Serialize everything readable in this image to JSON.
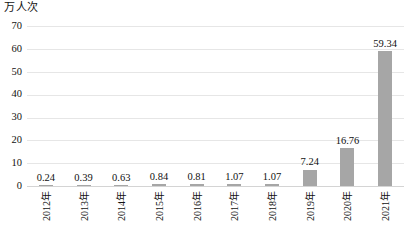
{
  "chart_data": {
    "type": "bar",
    "title": "",
    "unit_label": "万人次",
    "xlabel": "",
    "ylabel": "万人次",
    "ylim": [
      0,
      70
    ],
    "ytick_step": 10,
    "yticks": [
      "70",
      "60",
      "50",
      "40",
      "30",
      "20",
      "10",
      "0"
    ],
    "grid": true,
    "legend": "none",
    "bar_color": "#a6a6a6",
    "gridline_color": "#e6e6e6",
    "categories": [
      "2012年",
      "2013年",
      "2014年",
      "2015年",
      "2016年",
      "2017年",
      "2018年",
      "2019年",
      "2020年",
      "2021年"
    ],
    "values": [
      0.24,
      0.39,
      0.63,
      0.84,
      0.81,
      1.07,
      1.07,
      7.24,
      16.76,
      59.34
    ],
    "value_labels": [
      "0.24",
      "0.39",
      "0.63",
      "0.84",
      "0.81",
      "1.07",
      "1.07",
      "7.24",
      "16.76",
      "59.34"
    ]
  }
}
